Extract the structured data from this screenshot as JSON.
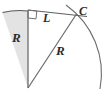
{
  "figure": {
    "background_color": "#ffffff",
    "stroke_color": "#6b6b6b",
    "stroke_dark_color": "#4a4a4a",
    "fill_color": "#e2e2e2",
    "labels": {
      "radius_vertical": "R",
      "radius_slant": "R",
      "chord": "L",
      "point": "C"
    },
    "markers": {
      "right_angle": "right-angle-square"
    },
    "geometry": {
      "apex_x": 28,
      "apex_y": 88,
      "vertical_top_x": 28,
      "vertical_top_y": 11,
      "point_c_x": 76,
      "point_c_y": 14,
      "small_arc_start_x": 2,
      "small_arc_start_y": 12,
      "large_arc_end_x": 100,
      "large_arc_end_y": 89
    }
  }
}
